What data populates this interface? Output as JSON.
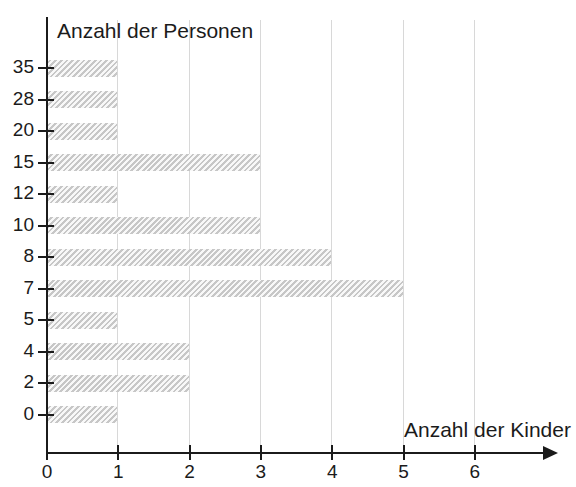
{
  "chart": {
    "type": "bar",
    "orientation": "horizontal",
    "y_axis_title": "Anzahl der Personen",
    "x_axis_title": "Anzahl der Kinder",
    "bar_color": "#e4e4e4",
    "axis_color": "#1b1b1b",
    "gridline_color": "#d8d8d8"
  },
  "chart_data": {
    "type": "bar",
    "title": "",
    "subtitle": "",
    "xlabel": "Anzahl der Kinder",
    "ylabel": "Anzahl der Personen",
    "orientation": "horizontal",
    "categories": [
      "35",
      "28",
      "20",
      "15",
      "12",
      "10",
      "8",
      "7",
      "5",
      "4",
      "2",
      "0"
    ],
    "values": [
      1,
      1,
      1,
      3,
      1,
      3,
      4,
      5,
      1,
      2,
      2,
      1
    ],
    "xlim": [
      0,
      7
    ],
    "xticks": [
      "0",
      "1",
      "2",
      "3",
      "4",
      "5",
      "6"
    ],
    "yticks": [
      "35",
      "28",
      "20",
      "15",
      "12",
      "10",
      "8",
      "7",
      "5",
      "4",
      "2",
      "0"
    ],
    "grid": "vertical",
    "legend": "none",
    "annotations": []
  },
  "y_ticks": [
    {
      "label": "35",
      "value": 1
    },
    {
      "label": "28",
      "value": 1
    },
    {
      "label": "20",
      "value": 1
    },
    {
      "label": "15",
      "value": 3
    },
    {
      "label": "12",
      "value": 1
    },
    {
      "label": "10",
      "value": 3
    },
    {
      "label": "8",
      "value": 4
    },
    {
      "label": "7",
      "value": 5
    },
    {
      "label": "5",
      "value": 1
    },
    {
      "label": "4",
      "value": 2
    },
    {
      "label": "2",
      "value": 2
    },
    {
      "label": "0",
      "value": 1
    }
  ],
  "x_ticks": [
    {
      "label": "0"
    },
    {
      "label": "1"
    },
    {
      "label": "2"
    },
    {
      "label": "3"
    },
    {
      "label": "4"
    },
    {
      "label": "5"
    },
    {
      "label": "6"
    }
  ]
}
